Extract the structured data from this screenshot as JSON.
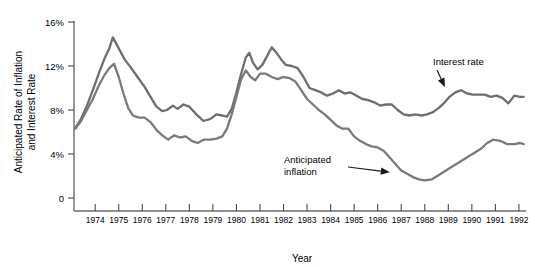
{
  "chart_data": {
    "type": "line",
    "title": "",
    "xlabel": "Year",
    "ylabel": "Anticipated Rate of Inflation and Interest Rate",
    "ylabel_line1": "Anticipated Rate of  Inflation",
    "ylabel_line2": "and Interest Rate",
    "grid": false,
    "legend_position": "inline-annotations",
    "xlim": [
      1973.1,
      1992.3
    ],
    "ylim": [
      0,
      16
    ],
    "ytick_labels": [
      "16%",
      "12%",
      "8%",
      "4%",
      "0"
    ],
    "ytick_values": [
      16,
      12,
      8,
      4,
      0
    ],
    "xtick_labels": [
      "1974",
      "1975",
      "1976",
      "1977",
      "1978",
      "1979",
      "1980",
      "1981",
      "1982",
      "1983",
      "1984",
      "1985",
      "1986",
      "1987",
      "1988",
      "1989",
      "1990",
      "1991",
      "1992"
    ],
    "xtick_values": [
      1974,
      1975,
      1976,
      1977,
      1978,
      1979,
      1980,
      1981,
      1982,
      1983,
      1984,
      1985,
      1986,
      1987,
      1988,
      1989,
      1990,
      1991,
      1992
    ],
    "annotations": [
      {
        "text_line1": "Interest rate",
        "text_line2": "",
        "label": "Interest rate",
        "points_to_x": 1988.9,
        "points_to_y": 9.8
      },
      {
        "text_line1": "Anticipated",
        "text_line2": "inflation",
        "label": "Anticipated inflation",
        "points_to_x": 1986.6,
        "points_to_y": 1.8
      }
    ],
    "series": [
      {
        "name": "Interest rate",
        "color": "#6e6e6e",
        "x": [
          1973.15,
          1973.4,
          1973.65,
          1973.9,
          1974.15,
          1974.4,
          1974.6,
          1974.75,
          1975.0,
          1975.25,
          1975.5,
          1975.8,
          1976.1,
          1976.35,
          1976.6,
          1976.85,
          1977.05,
          1977.3,
          1977.5,
          1977.75,
          1978.0,
          1978.3,
          1978.6,
          1978.9,
          1979.15,
          1979.4,
          1979.6,
          1979.8,
          1980.0,
          1980.2,
          1980.4,
          1980.55,
          1980.7,
          1980.9,
          1981.1,
          1981.3,
          1981.5,
          1981.7,
          1981.9,
          1982.1,
          1982.35,
          1982.6,
          1982.85,
          1983.1,
          1983.35,
          1983.6,
          1983.85,
          1984.1,
          1984.35,
          1984.6,
          1984.85,
          1985.1,
          1985.35,
          1985.6,
          1985.85,
          1986.1,
          1986.35,
          1986.6,
          1986.85,
          1987.1,
          1987.35,
          1987.6,
          1987.85,
          1988.1,
          1988.35,
          1988.6,
          1988.85,
          1989.05,
          1989.3,
          1989.55,
          1989.8,
          1990.05,
          1990.3,
          1990.55,
          1990.8,
          1991.05,
          1991.3,
          1991.55,
          1991.8,
          1992.05,
          1992.2
        ],
        "y": [
          6.35,
          7.2,
          8.4,
          9.8,
          11.3,
          12.7,
          13.6,
          14.6,
          13.6,
          12.6,
          11.9,
          11.0,
          10.1,
          9.2,
          8.3,
          7.9,
          8.0,
          8.4,
          8.1,
          8.5,
          8.3,
          7.6,
          7.0,
          7.2,
          7.6,
          7.5,
          7.4,
          8.1,
          9.6,
          11.3,
          12.8,
          13.2,
          12.3,
          11.7,
          12.1,
          12.9,
          13.7,
          13.2,
          12.6,
          12.1,
          12.0,
          11.8,
          11.0,
          10.0,
          9.8,
          9.6,
          9.3,
          9.5,
          9.8,
          9.5,
          9.6,
          9.3,
          9.0,
          8.9,
          8.7,
          8.4,
          8.5,
          8.5,
          8.0,
          7.6,
          7.5,
          7.6,
          7.5,
          7.6,
          7.8,
          8.2,
          8.7,
          9.2,
          9.6,
          9.8,
          9.5,
          9.4,
          9.4,
          9.4,
          9.2,
          9.3,
          9.1,
          8.6,
          9.3,
          9.2,
          9.2
        ]
      },
      {
        "name": "Anticipated inflation",
        "color": "#7a7a7a",
        "x": [
          1973.15,
          1973.4,
          1973.65,
          1973.9,
          1974.15,
          1974.4,
          1974.6,
          1974.8,
          1975.0,
          1975.2,
          1975.4,
          1975.6,
          1975.85,
          1976.1,
          1976.35,
          1976.6,
          1976.85,
          1977.1,
          1977.35,
          1977.6,
          1977.85,
          1978.1,
          1978.35,
          1978.6,
          1978.9,
          1979.15,
          1979.4,
          1979.6,
          1979.8,
          1980.0,
          1980.2,
          1980.4,
          1980.6,
          1980.8,
          1981.0,
          1981.25,
          1981.5,
          1981.75,
          1982.0,
          1982.25,
          1982.5,
          1982.75,
          1983.0,
          1983.25,
          1983.5,
          1983.75,
          1984.0,
          1984.25,
          1984.5,
          1984.75,
          1985.0,
          1985.25,
          1985.5,
          1985.75,
          1986.0,
          1986.25,
          1986.5,
          1986.75,
          1987.0,
          1987.25,
          1987.5,
          1987.75,
          1988.0,
          1988.3,
          1988.6,
          1988.9,
          1989.2,
          1989.5,
          1989.8,
          1990.1,
          1990.4,
          1990.65,
          1990.9,
          1991.2,
          1991.5,
          1991.8,
          1992.05,
          1992.2
        ],
        "y": [
          6.3,
          7.0,
          8.0,
          9.0,
          10.2,
          11.2,
          11.8,
          12.2,
          11.0,
          9.5,
          8.2,
          7.5,
          7.3,
          7.3,
          6.9,
          6.2,
          5.7,
          5.3,
          5.7,
          5.5,
          5.6,
          5.2,
          5.0,
          5.3,
          5.3,
          5.4,
          5.6,
          6.3,
          7.6,
          9.2,
          10.8,
          11.6,
          11.0,
          10.7,
          11.3,
          11.3,
          11.0,
          10.8,
          11.0,
          10.9,
          10.6,
          9.8,
          9.0,
          8.5,
          8.0,
          7.6,
          7.1,
          6.6,
          6.3,
          6.3,
          5.6,
          5.2,
          4.9,
          4.7,
          4.6,
          4.3,
          3.7,
          3.1,
          2.5,
          2.2,
          1.9,
          1.7,
          1.6,
          1.7,
          2.1,
          2.5,
          2.9,
          3.3,
          3.7,
          4.1,
          4.5,
          5.0,
          5.3,
          5.2,
          4.9,
          4.9,
          5.0,
          4.9
        ]
      }
    ]
  }
}
